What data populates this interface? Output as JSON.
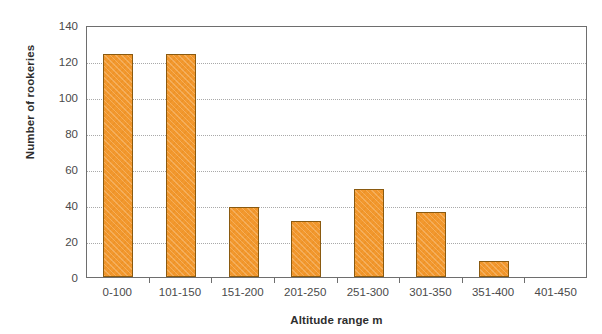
{
  "chart_data": {
    "type": "bar",
    "title": "",
    "xlabel": "Altitude range m",
    "ylabel": "Number of rookeries",
    "categories": [
      "0-100",
      "101-150",
      "151-200",
      "201-250",
      "251-300",
      "301-350",
      "351-400",
      "401-450"
    ],
    "values": [
      124,
      124,
      39,
      31,
      49,
      36,
      9,
      0
    ],
    "ylim": [
      0,
      140
    ],
    "yticks": [
      0,
      20,
      40,
      60,
      80,
      100,
      120,
      140
    ],
    "ytick_labels": [
      "0",
      "20",
      "40",
      "60",
      "80",
      "100",
      "120",
      "140"
    ],
    "grid": "horizontal-dotted",
    "legend": "none",
    "series": [
      {
        "name": "Number of rookeries",
        "color": "#f2982e",
        "values": [
          124,
          124,
          39,
          31,
          49,
          36,
          9,
          0
        ]
      }
    ]
  },
  "colors": {
    "bar_fill": "#f2982e",
    "bar_border": "#8a5a10",
    "axis": "#6e6e6e",
    "gridline": "#a9a9a9",
    "text": "#4a4a4a",
    "background": "#ffffff"
  }
}
